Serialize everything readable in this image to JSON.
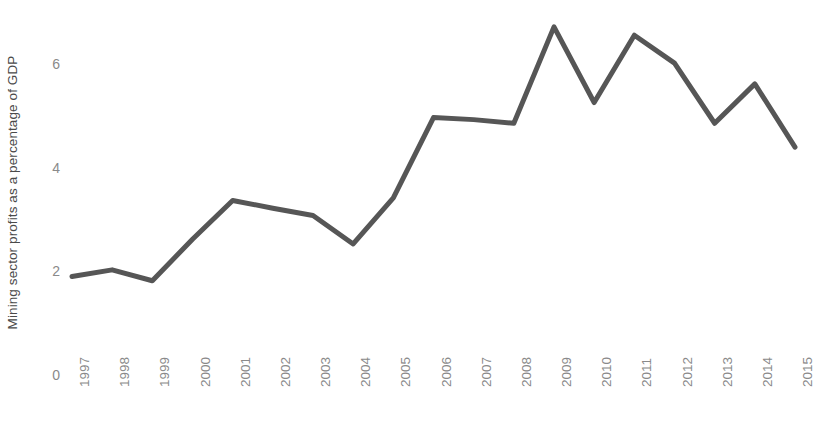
{
  "chart_data": {
    "type": "line",
    "title": "",
    "subtitle": "",
    "xlabel": "",
    "ylabel": "Mining sector profits as a percentage of GDP",
    "categories": [
      "1997",
      "1998",
      "1999",
      "2000",
      "2001",
      "2002",
      "2003",
      "2004",
      "2005",
      "2006",
      "2007",
      "2008",
      "2009",
      "2010",
      "2011",
      "2012",
      "2013",
      "2014",
      "2015"
    ],
    "values": [
      1.9,
      2.03,
      1.82,
      2.62,
      3.37,
      3.22,
      3.08,
      2.53,
      3.42,
      4.97,
      4.93,
      4.86,
      6.72,
      5.26,
      6.56,
      6.02,
      4.86,
      5.62,
      4.4
    ],
    "series": [
      {
        "name": "Mining sector profits as a percentage of GDP",
        "values": [
          1.9,
          2.03,
          1.82,
          2.62,
          3.37,
          3.22,
          3.08,
          2.53,
          3.42,
          4.97,
          4.93,
          4.86,
          6.72,
          5.26,
          6.56,
          6.02,
          4.86,
          5.62,
          4.4
        ],
        "color": "#565656"
      }
    ],
    "ylim": [
      0,
      7.4
    ],
    "yticks": [
      0,
      2,
      4,
      6
    ],
    "ytick_labels": [
      "0",
      "2",
      "4",
      "6"
    ],
    "grid": false,
    "legend": "none",
    "axis_lines": "none",
    "line_color": "#565656",
    "line_width": 5,
    "tick_label_color": "#8a8a8a",
    "axis_title_color": "#4a4a4a"
  }
}
